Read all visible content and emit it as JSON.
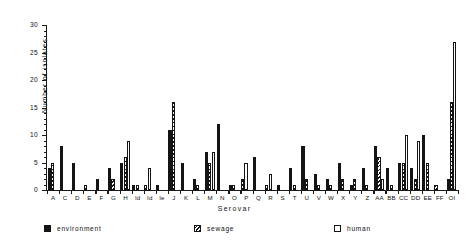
{
  "chart_data": {
    "type": "bar",
    "title": "",
    "xlabel": "Serovar",
    "ylabel": "Number of isolates",
    "ylim": [
      0,
      30
    ],
    "yticks": [
      0,
      5,
      10,
      15,
      20,
      25,
      30
    ],
    "ytick_labels": [
      "0",
      "5",
      "10",
      "15",
      "20",
      "25",
      "30"
    ],
    "grid": false,
    "legend_position": "below-axis",
    "categories": [
      "A",
      "C",
      "D",
      "E",
      "F",
      "G",
      "H",
      "Id",
      "Id",
      "Ie",
      "J",
      "K",
      "L",
      "M",
      "N",
      "O",
      "P",
      "Q",
      "R",
      "S",
      "T",
      "U",
      "V",
      "W",
      "X",
      "Y",
      "Z",
      "AA",
      "BB",
      "CC",
      "DD",
      "EE",
      "FF",
      "OI"
    ],
    "series": [
      {
        "name": "environment",
        "color": "#141414",
        "fill": "solid-black",
        "values": [
          4,
          8,
          5,
          0,
          2,
          4,
          5,
          1,
          0,
          1,
          11,
          5,
          2,
          7,
          12,
          1,
          0,
          6,
          0,
          1,
          4,
          8,
          3,
          2,
          5,
          1,
          4,
          8,
          4,
          5,
          4,
          10,
          0,
          2
        ]
      },
      {
        "name": "sewage",
        "color": "#141414",
        "fill": "diagonal-hatch",
        "values": [
          5,
          0,
          0,
          1,
          0,
          2,
          6,
          1,
          1,
          0,
          16,
          0,
          1,
          5,
          0,
          1,
          2,
          0,
          1,
          0,
          1,
          2,
          1,
          1,
          2,
          2,
          1,
          6,
          1,
          5,
          2,
          5,
          1,
          16
        ]
      },
      {
        "name": "human",
        "color": "#ffffff",
        "fill": "open-white",
        "values": [
          0,
          0,
          0,
          0,
          0,
          0,
          9,
          0,
          4,
          0,
          0,
          0,
          0,
          7,
          0,
          0,
          5,
          0,
          3,
          0,
          0,
          0,
          0,
          0,
          0,
          0,
          0,
          2,
          0,
          10,
          9,
          0,
          0,
          27
        ]
      }
    ],
    "legend": [
      {
        "label": "environment",
        "key": "environment"
      },
      {
        "label": "sewage",
        "key": "sewage"
      },
      {
        "label": "human",
        "key": "human"
      }
    ]
  }
}
